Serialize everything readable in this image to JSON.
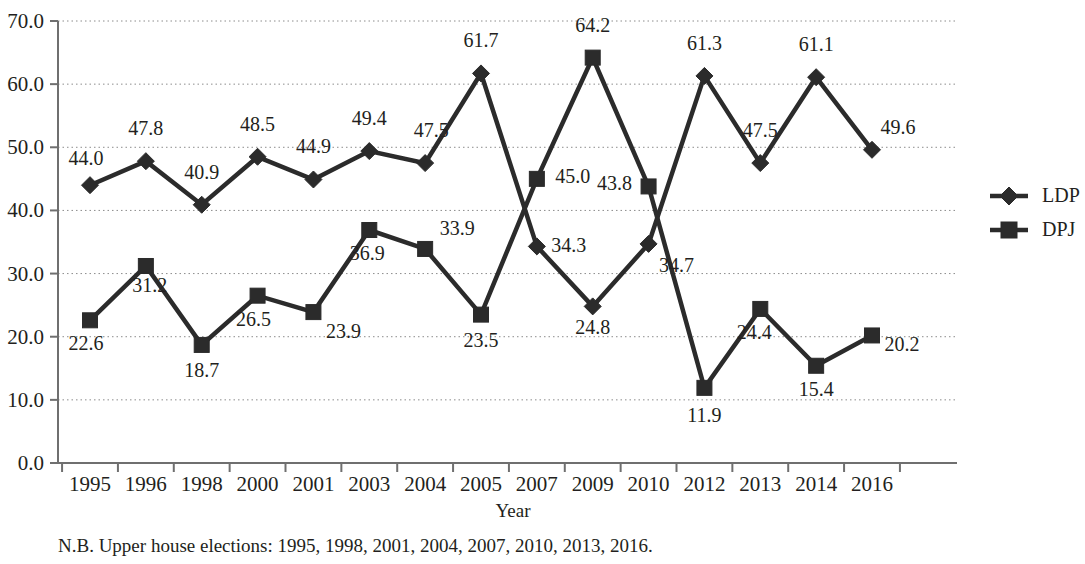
{
  "chart_data": {
    "type": "line",
    "title": "",
    "xlabel": "Year",
    "ylabel": "",
    "categories": [
      "1995",
      "1996",
      "1998",
      "2000",
      "2001",
      "2003",
      "2004",
      "2005",
      "2007",
      "2009",
      "2010",
      "2012",
      "2013",
      "2014",
      "2016"
    ],
    "ylim": [
      0.0,
      70.0
    ],
    "ytick_labels": [
      "0.0",
      "10.0",
      "20.0",
      "30.0",
      "40.0",
      "50.0",
      "60.0",
      "70.0"
    ],
    "ytick_values": [
      0.0,
      10.0,
      20.0,
      30.0,
      40.0,
      50.0,
      60.0,
      70.0
    ],
    "grid": true,
    "legend_position": "right",
    "series": [
      {
        "name": "LDP",
        "marker": "diamond",
        "color": "#2b2b2b",
        "values": [
          44.0,
          47.8,
          40.9,
          48.5,
          44.9,
          49.4,
          47.5,
          61.7,
          34.3,
          24.8,
          34.7,
          61.3,
          47.5,
          61.1,
          49.6
        ],
        "labels": [
          "44.0",
          "47.8",
          "40.9",
          "48.5",
          "44.9",
          "49.4",
          "47.5",
          "61.7",
          "34.3",
          "24.8",
          "34.7",
          "61.3",
          "47.5",
          "61.1",
          "49.6"
        ]
      },
      {
        "name": "DPJ",
        "marker": "square",
        "color": "#2b2b2b",
        "values": [
          22.6,
          31.2,
          18.7,
          26.5,
          23.9,
          36.9,
          33.9,
          23.5,
          45.0,
          64.2,
          43.8,
          11.9,
          24.4,
          15.4,
          20.2
        ],
        "labels": [
          "22.6",
          "31.2",
          "18.7",
          "26.5",
          "23.9",
          "36.9",
          "33.9",
          "23.5",
          "45.0",
          "64.2",
          "43.8",
          "11.9",
          "24.4",
          "15.4",
          "20.2"
        ]
      }
    ],
    "note": "N.B. Upper house elections: 1995, 1998, 2001, 2004, 2007, 2010, 2013, 2016."
  },
  "legend": {
    "items": [
      {
        "label": "LDP",
        "marker": "diamond"
      },
      {
        "label": "DPJ",
        "marker": "square"
      }
    ]
  },
  "colors": {
    "ink": "#231f20",
    "series": "#2b2b2b",
    "grid": "#8c8c8c",
    "axis": "#6f6f6f",
    "background": "#ffffff"
  }
}
